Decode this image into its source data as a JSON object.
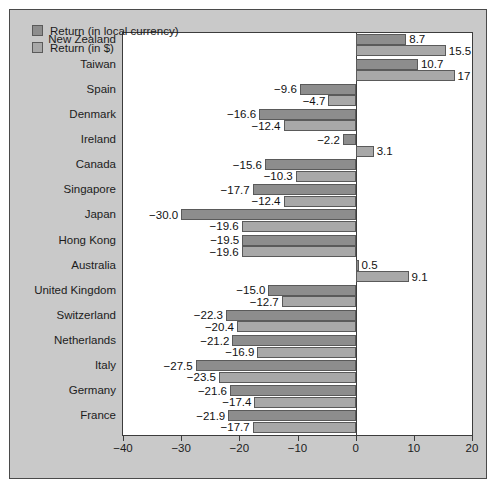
{
  "chart_data": {
    "type": "bar",
    "orientation": "horizontal",
    "title": "",
    "xlabel": "",
    "ylabel": "",
    "xlim": [
      -40,
      20
    ],
    "xticks": [
      "-40",
      "-30",
      "-20",
      "-10",
      "0",
      "10",
      "20"
    ],
    "xtick_values": [
      -40,
      -30,
      -20,
      -10,
      0,
      10,
      20
    ],
    "grid": false,
    "legend_position": "top-left",
    "categories": [
      "New Zealand",
      "Taiwan",
      "Spain",
      "Denmark",
      "Ireland",
      "Canada",
      "Singapore",
      "Japan",
      "Hong Kong",
      "Australia",
      "United Kingdom",
      "Switzerland",
      "Netherlands",
      "Italy",
      "Germany",
      "France"
    ],
    "series": [
      {
        "name": "Return (in local currency)",
        "color": "#8d8d8d",
        "values": [
          8.7,
          10.7,
          -9.6,
          -16.6,
          -2.2,
          -15.6,
          -17.7,
          -30.0,
          -19.5,
          0.5,
          -15.0,
          -22.3,
          -21.2,
          -27.5,
          -21.6,
          -21.9
        ],
        "labels": [
          "8.7",
          "10.7",
          "-9.6",
          "-16.6",
          "-2.2",
          "-15.6",
          "-17.7",
          "-30.0",
          "-19.5",
          "0.5",
          "-15.0",
          "-22.3",
          "-21.2",
          "-27.5",
          "-21.6",
          "-21.9"
        ]
      },
      {
        "name": "Return (in $)",
        "color": "#a8a8a8",
        "values": [
          15.5,
          17,
          -4.7,
          -12.4,
          3.1,
          -10.3,
          -12.4,
          -19.6,
          -19.6,
          9.1,
          -12.7,
          -20.4,
          -16.9,
          -23.5,
          -17.4,
          -17.7
        ],
        "labels": [
          "15.5",
          "17",
          "-4.7",
          "-12.4",
          "3.1",
          "-10.3",
          "-12.4",
          "-19.6",
          "-19.6",
          "9.1",
          "-12.7",
          "-20.4",
          "-16.9",
          "-23.5",
          "-17.4",
          "-17.7"
        ]
      }
    ]
  },
  "legend": {
    "items": [
      {
        "label": "Return (in local currency)",
        "swatch": "local"
      },
      {
        "label": "Return (in $)",
        "swatch": "usd"
      }
    ]
  },
  "colors": {
    "panel_background": "#c9c9c9",
    "plot_background": "#ffffff",
    "series_local": "#8d8d8d",
    "series_usd": "#a8a8a8",
    "axis": "#3c3c3c",
    "text": "#1c1c1c"
  }
}
